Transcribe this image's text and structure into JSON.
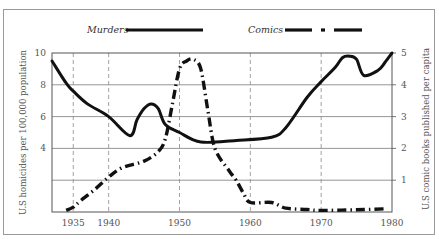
{
  "chart_data": {
    "type": "line",
    "title": "",
    "xlabel": "",
    "ylabel": "U.S homicides per 100,000 population",
    "ylabel_right": "U.S comic books published per capita",
    "xlim": [
      1932,
      1980
    ],
    "ylim": [
      0,
      10
    ],
    "ylim_right": [
      0,
      5
    ],
    "x_ticks": [
      1935,
      1940,
      1950,
      1960,
      1970,
      1980
    ],
    "x_tick_labels": [
      "1935",
      "1940",
      "1950",
      "1960",
      "1970",
      "1980"
    ],
    "y_ticks": [
      4,
      6,
      8,
      10
    ],
    "y_tick_labels": [
      "4",
      "6",
      "8",
      "10"
    ],
    "y_ticks_right": [
      1,
      2,
      3,
      4,
      5
    ],
    "y_tick_labels_right": [
      "1",
      "2",
      "3",
      "4",
      "5"
    ],
    "grid": {
      "horizontal": [
        2,
        4,
        6,
        8
      ],
      "vertical_dashed": [
        1935,
        1940,
        1950,
        1960,
        1970
      ]
    },
    "legend": {
      "position": "top",
      "entries": [
        "Murders",
        "Comics"
      ]
    },
    "series": [
      {
        "name": "Murders",
        "axis": "left",
        "style": "solid",
        "x": [
          1932,
          1934,
          1935,
          1937,
          1940,
          1943,
          1944,
          1945,
          1946,
          1947,
          1948,
          1950,
          1953,
          1958,
          1963,
          1965,
          1968,
          1970,
          1972,
          1973,
          1974,
          1975,
          1976,
          1978,
          1979,
          1980
        ],
        "values": [
          9.5,
          8.1,
          7.6,
          6.8,
          6.0,
          4.8,
          5.8,
          6.5,
          6.8,
          6.5,
          5.5,
          5.0,
          4.4,
          4.5,
          4.7,
          5.3,
          7.2,
          8.2,
          9.1,
          9.7,
          9.8,
          9.6,
          8.6,
          8.9,
          9.4,
          10.0
        ]
      },
      {
        "name": "Comics",
        "axis": "right",
        "style": "dash-dot",
        "x": [
          1934,
          1935,
          1936,
          1938,
          1940,
          1942,
          1945,
          1947,
          1948,
          1949,
          1950,
          1951,
          1952,
          1953,
          1954,
          1955,
          1957,
          1958,
          1959,
          1960,
          1963,
          1965,
          1968,
          1970,
          1975,
          1979
        ],
        "values": [
          0.05,
          0.15,
          0.35,
          0.7,
          1.1,
          1.4,
          1.6,
          1.9,
          2.3,
          3.4,
          4.5,
          4.75,
          4.8,
          4.5,
          3.2,
          2.0,
          1.3,
          1.0,
          0.6,
          0.3,
          0.3,
          0.12,
          0.08,
          0.05,
          0.07,
          0.1
        ]
      }
    ]
  },
  "legend": {
    "murders_label": "Murders",
    "comics_label": "Comics"
  },
  "axes": {
    "left_title": "U.S homicides per 100,000 population",
    "right_title": "U.S comic books published per capita"
  }
}
